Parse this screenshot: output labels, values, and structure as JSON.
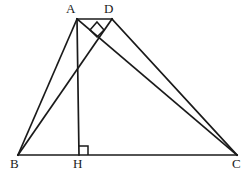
{
  "figure": {
    "kind": "geometry-diagram",
    "width": 252,
    "height": 177,
    "background_color": "#ffffff",
    "stroke_color": "#1a1a1a",
    "label_color": "#1a1a1a"
  },
  "points": {
    "A": {
      "label": "A",
      "x": 77,
      "y": 19,
      "label_x": 66,
      "label_y": 2
    },
    "D": {
      "label": "D",
      "x": 112,
      "y": 19,
      "label_x": 104,
      "label_y": 2
    },
    "B": {
      "label": "B",
      "x": 18,
      "y": 155,
      "label_x": 10,
      "label_y": 157
    },
    "H": {
      "label": "H",
      "x": 79,
      "y": 155,
      "label_x": 73,
      "label_y": 157
    },
    "C": {
      "label": "C",
      "x": 237,
      "y": 155,
      "label_x": 232,
      "label_y": 157
    }
  },
  "segments": [
    {
      "name": "BC",
      "from": "B",
      "to": "C"
    },
    {
      "name": "AB",
      "from": "A",
      "to": "B"
    },
    {
      "name": "AC",
      "from": "A",
      "to": "C"
    },
    {
      "name": "AD",
      "from": "A",
      "to": "D"
    },
    {
      "name": "AH",
      "from": "A",
      "to": "H"
    },
    {
      "name": "BD",
      "from": "B",
      "to": "D"
    },
    {
      "name": "DC",
      "from": "D",
      "to": "C"
    }
  ],
  "right_angles": [
    {
      "name": "right-angle-at-H",
      "vertex": "H",
      "between": "AH and HC",
      "marker": "square"
    },
    {
      "name": "right-angle-at-intersection-BD-AC",
      "vertex": "P",
      "between": "BD and AC",
      "marker": "square",
      "x": 97,
      "y": 29
    }
  ]
}
